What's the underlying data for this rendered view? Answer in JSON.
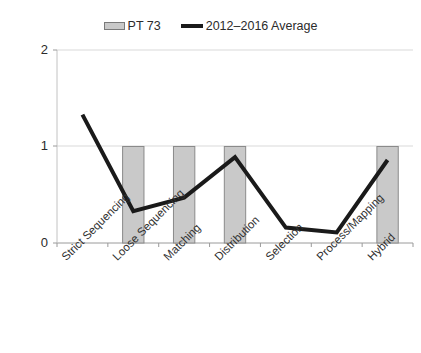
{
  "legend": {
    "entries": [
      {
        "label": "PT 73",
        "type": "bar",
        "color": "#c9c9c9"
      },
      {
        "label": "2012–2016 Average",
        "type": "line",
        "color": "#1a1a1a"
      }
    ]
  },
  "axis": {
    "y_ticks": [
      "0",
      "1",
      "2"
    ]
  },
  "chart_data": {
    "type": "bar",
    "title": "",
    "subtitle": "",
    "xlabel": "",
    "ylabel": "",
    "ylim": [
      0,
      2
    ],
    "yticks": [
      0,
      1,
      2
    ],
    "grid": true,
    "legend_position": "top-center",
    "categories": [
      "Strict Sequencing",
      "Loose Sequencing",
      "Matching",
      "Distribution",
      "Selection",
      "Process/Mapping",
      "Hybrid"
    ],
    "series": [
      {
        "name": "PT 73",
        "type": "bar",
        "color": "#c9c9c9",
        "values": [
          0,
          1,
          1,
          1,
          0,
          0,
          1
        ]
      },
      {
        "name": "2012–2016 Average",
        "type": "line",
        "color": "#1a1a1a",
        "values": [
          1.33,
          0.33,
          0.47,
          0.89,
          0.16,
          0.11,
          0.86
        ]
      }
    ]
  }
}
